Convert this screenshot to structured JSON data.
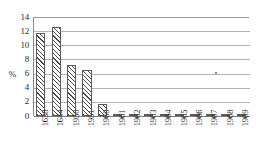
{
  "chart_data": {
    "type": "bar",
    "title": "",
    "subtitle": "",
    "xlabel": "",
    "ylabel": "%",
    "ylim": [
      0,
      14
    ],
    "ytick_step": 2,
    "yticks": [
      0,
      2,
      4,
      6,
      8,
      10,
      12,
      14
    ],
    "ytick_labels": [
      "0",
      "2",
      "4",
      "6",
      "8",
      "10",
      "12",
      "14"
    ],
    "grid": true,
    "grid_axis": "y",
    "legend": false,
    "legend_position": "none",
    "orientation": "vertical",
    "categories": [
      "1638",
      "1644",
      "1950",
      "1951",
      "1960",
      "1961",
      "1962",
      "1963",
      "1964",
      "1965",
      "1966",
      "1967",
      "1968",
      "1969"
    ],
    "values": [
      11.7,
      12.6,
      7.2,
      6.5,
      1.7,
      0.15,
      0.12,
      0.1,
      0.1,
      0.1,
      0.1,
      0.1,
      0.1,
      0.1
    ],
    "bar_style": {
      "fill": "#ffffff",
      "hatch": "diagonal",
      "edge_color": "#5a5a5a"
    },
    "annotations": []
  },
  "colors": {
    "background": "#ffffff",
    "grid": "#b4b4b4",
    "axis": "#8a8a8a",
    "baseline": "#7d7d7d",
    "text": "#232323",
    "hatch": "#4d4d4d"
  },
  "axis": {
    "y_label_text": "%"
  }
}
